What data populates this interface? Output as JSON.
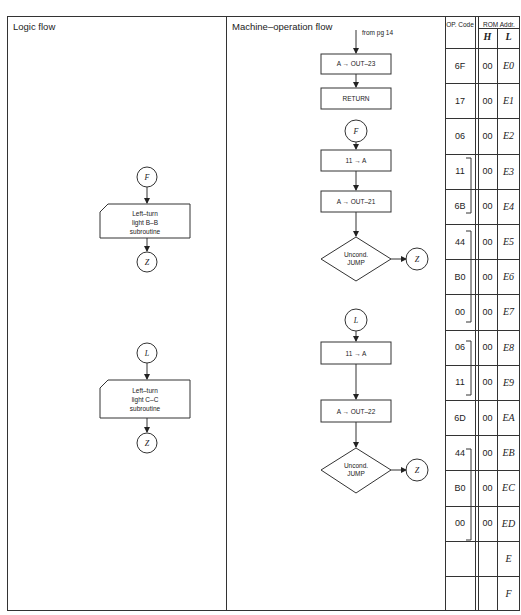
{
  "panels": {
    "logic_title": "Logic flow",
    "machine_title": "Machine–operation flow"
  },
  "table_header": {
    "op_code": "OP. Code",
    "rom_addr": "ROM Addr.",
    "h": "H",
    "l": "L"
  },
  "table_rows": [
    {
      "op": "6F",
      "h": "00",
      "l": "E0"
    },
    {
      "op": "17",
      "h": "00",
      "l": "E1"
    },
    {
      "op": "06",
      "h": "00",
      "l": "E2"
    },
    {
      "op": "11",
      "h": "00",
      "l": "E3"
    },
    {
      "op": "6B",
      "h": "00",
      "l": "E4"
    },
    {
      "op": "44",
      "h": "00",
      "l": "E5"
    },
    {
      "op": "B0",
      "h": "00",
      "l": "E6"
    },
    {
      "op": "00",
      "h": "00",
      "l": "E7"
    },
    {
      "op": "06",
      "h": "00",
      "l": "E8"
    },
    {
      "op": "11",
      "h": "00",
      "l": "E9"
    },
    {
      "op": "6D",
      "h": "00",
      "l": "EA"
    },
    {
      "op": "44",
      "h": "00",
      "l": "EB"
    },
    {
      "op": "B0",
      "h": "00",
      "l": "EC"
    },
    {
      "op": "00",
      "h": "00",
      "l": "ED"
    },
    {
      "op": "",
      "h": "",
      "l": "E"
    },
    {
      "op": "",
      "h": "",
      "l": "F"
    }
  ],
  "logic_flow": {
    "block1": {
      "entry": "F",
      "lines": [
        "Left–turn",
        "light B–B",
        "subroutine"
      ],
      "exit": "Z"
    },
    "block2": {
      "entry": "L",
      "lines": [
        "Left–turn",
        "light C–C",
        "subroutine"
      ],
      "exit": "Z"
    }
  },
  "machine_flow": {
    "from_label": "from pg 14",
    "step1": "A → OUT–23",
    "step2": "RETURN",
    "connector_f": "F",
    "step3": "11 → A",
    "step4": "A → OUT–21",
    "decision1": [
      "Uncond.",
      "JUMP"
    ],
    "exit1": "Z",
    "connector_l": "L",
    "step5": "11 → A",
    "step6": "A → OUT–22",
    "decision2": [
      "Uncond.",
      "JUMP"
    ],
    "exit2": "Z"
  }
}
